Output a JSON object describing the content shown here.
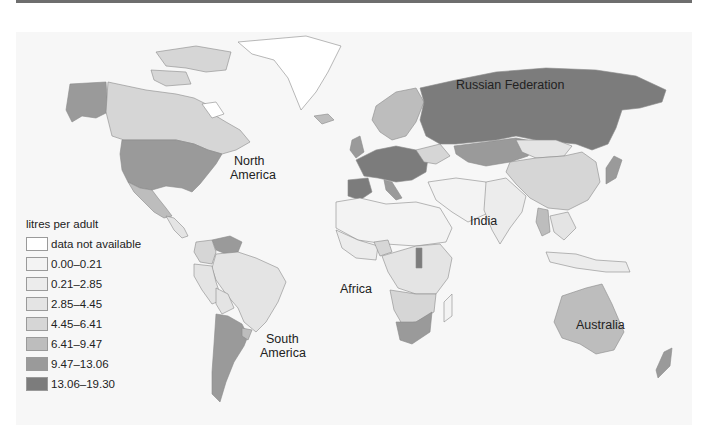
{
  "map": {
    "region_labels": {
      "russia": "Russian Federation",
      "north_america_1": "North",
      "north_america_2": "America",
      "south_america_1": "South",
      "south_america_2": "America",
      "africa": "Africa",
      "india": "India",
      "australia": "Australia"
    },
    "legend": {
      "title": "litres per adult",
      "items": [
        {
          "label": "data not available",
          "color": "#ffffff"
        },
        {
          "label": "0.00–0.21",
          "color": "#f3f3f3"
        },
        {
          "label": "0.21–2.85",
          "color": "#ececec"
        },
        {
          "label": "2.85–4.45",
          "color": "#e4e4e4"
        },
        {
          "label": "4.45–6.41",
          "color": "#d6d6d6"
        },
        {
          "label": "6.41–9.47",
          "color": "#bdbdbd"
        },
        {
          "label": "9.47–13.06",
          "color": "#9a9a9a"
        },
        {
          "label": "13.06–19.30",
          "color": "#7c7c7c"
        }
      ]
    }
  }
}
